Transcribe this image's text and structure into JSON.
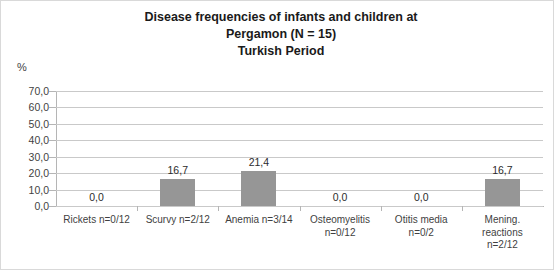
{
  "chart_data": {
    "type": "bar",
    "title": "Disease frequencies of infants and children at Pergamon (N = 15) Turkish Period",
    "title_lines": [
      "Disease frequencies of infants and children at",
      "Pergamon (N = 15)",
      "Turkish Period"
    ],
    "xlabel": "",
    "ylabel": "%",
    "ylim": [
      0,
      70
    ],
    "grid": true,
    "legend": "none",
    "decimal_separator": ",",
    "bar_color": "#969696",
    "categories": [
      "Rickets n=0/12",
      "Scurvy n=2/12",
      "Anemia n=3/14",
      "Osteomyelitis n=0/12",
      "Otitis media n=0/2",
      "Mening. reactions n=2/12"
    ],
    "category_label_lines": [
      [
        "Rickets n=0/12"
      ],
      [
        "Scurvy n=2/12"
      ],
      [
        "Anemia n=3/14"
      ],
      [
        "Osteomyelitis",
        "n=0/12"
      ],
      [
        "Otitis media",
        "n=0/2"
      ],
      [
        "Mening.",
        "reactions",
        "n=2/12"
      ]
    ],
    "values": [
      0.0,
      16.7,
      21.4,
      0.0,
      0.0,
      16.7
    ],
    "data_labels": [
      "0,0",
      "16,7",
      "21,4",
      "0,0",
      "0,0",
      "16,7"
    ],
    "ytick_values": [
      0,
      10,
      20,
      30,
      40,
      50,
      60,
      70
    ],
    "ytick_labels": [
      "0,0",
      "10,0",
      "20,0",
      "30,0",
      "40,0",
      "50,0",
      "60,0",
      "70,0"
    ]
  }
}
